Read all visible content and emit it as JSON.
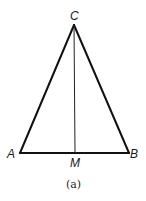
{
  "figure": {
    "caption": "(a)",
    "points": {
      "A": {
        "label": "A",
        "x": 20,
        "y": 153
      },
      "B": {
        "label": "B",
        "x": 129,
        "y": 153
      },
      "C": {
        "label": "C",
        "x": 74,
        "y": 25
      },
      "M": {
        "label": "M",
        "x": 75,
        "y": 153
      }
    },
    "segments": [
      {
        "from": "A",
        "to": "C",
        "weight": "thick"
      },
      {
        "from": "C",
        "to": "B",
        "weight": "thick"
      },
      {
        "from": "A",
        "to": "B",
        "weight": "thick"
      },
      {
        "from": "C",
        "to": "M",
        "weight": "thin"
      }
    ],
    "colors": {
      "stroke": "#111111",
      "background": "#ffffff"
    }
  }
}
